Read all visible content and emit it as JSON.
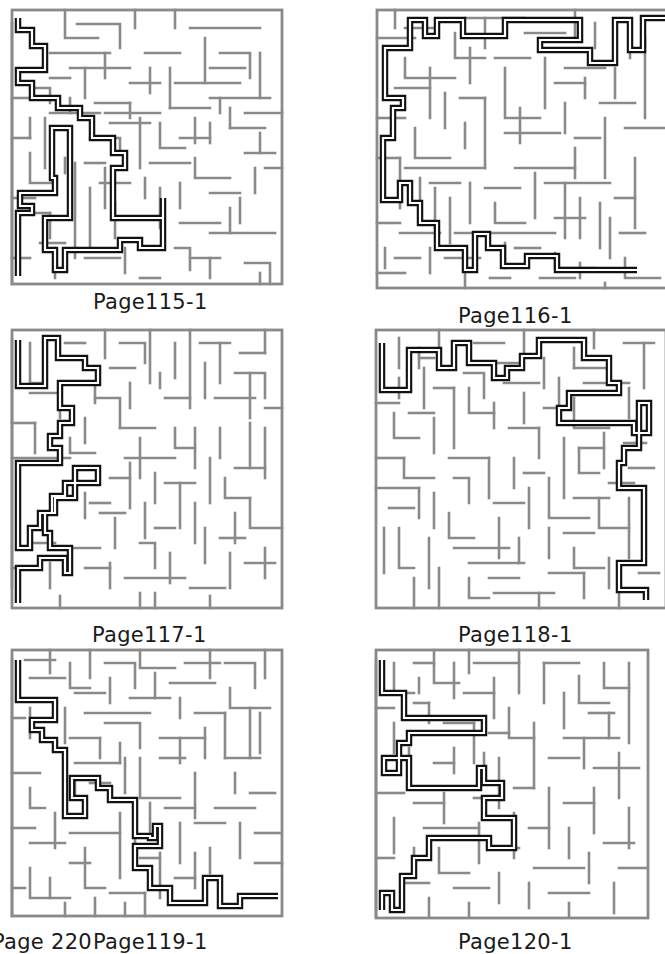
{
  "page": {
    "footer_page_number": "Page 220"
  },
  "colors": {
    "background": "#ffffff",
    "maze_walls": "#8a8a8a",
    "solution_path": "#111111",
    "label_text": "#1a1a1a"
  },
  "mazes": [
    {
      "label": "Page115-1",
      "position": "top-left"
    },
    {
      "label": "Page116-1",
      "position": "top-right"
    },
    {
      "label": "Page117-1",
      "position": "middle-left"
    },
    {
      "label": "Page118-1",
      "position": "middle-right"
    },
    {
      "label": "Page119-1",
      "position": "bottom-left"
    },
    {
      "label": "Page120-1",
      "position": "bottom-right"
    }
  ]
}
